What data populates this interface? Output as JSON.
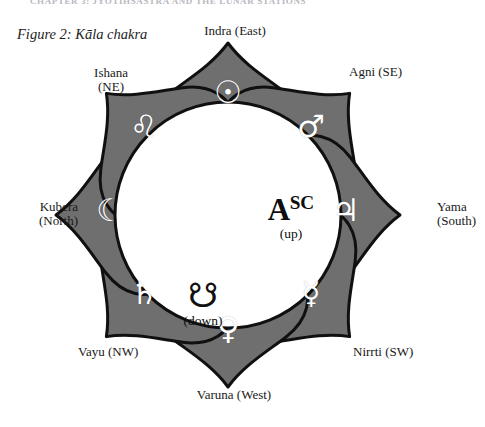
{
  "page": {
    "running_header": "CHAPTER 3: JYOTIHSASTRA AND THE LUNAR STATIONS",
    "figure_caption": "Figure 2: Kāla chakra",
    "background_color": "#ffffff",
    "petal_fill": "#6f6f6f",
    "petal_stroke": "#111111",
    "hub_fill": "#ffffff",
    "symbol_color": "#ffffff",
    "text_color": "#191919"
  },
  "diagram": {
    "name": "kala-chakra",
    "hub": {
      "ascendant": {
        "letter": "A",
        "superscript": "SC",
        "note": "(up)"
      },
      "descendant_node": {
        "glyph": "☋",
        "glyph_name": "descending-lunar-node-ketu",
        "note": "(down)"
      }
    },
    "petals": [
      {
        "id": "east",
        "direction_label": "Indra (East)",
        "deity": "Indra",
        "direction": "East",
        "glyph": "☉",
        "glyph_name": "sun-symbol",
        "planet": "Sun",
        "angle_deg": -90
      },
      {
        "id": "se",
        "direction_label": "Agni (SE)",
        "deity": "Agni",
        "direction": "SE",
        "glyph": "♂",
        "glyph_name": "mars-symbol",
        "planet": "Mars",
        "angle_deg": -45
      },
      {
        "id": "south",
        "direction_label": "Yama\n(South)",
        "direction_label_line1": "Yama",
        "direction_label_line2": "(South)",
        "deity": "Yama",
        "direction": "South",
        "glyph": "♃",
        "glyph_name": "jupiter-symbol",
        "planet": "Jupiter",
        "angle_deg": 0
      },
      {
        "id": "sw",
        "direction_label": "Nirrti (SW)",
        "deity": "Nirrti",
        "direction": "SW",
        "glyph": "☿",
        "glyph_name": "mercury-symbol",
        "planet": "Mercury",
        "angle_deg": 45
      },
      {
        "id": "west",
        "direction_label": "Varuna (West)",
        "deity": "Varuna",
        "direction": "West",
        "glyph": "♀",
        "glyph_name": "venus-symbol",
        "planet": "Venus",
        "angle_deg": 90
      },
      {
        "id": "nw",
        "direction_label": "Vayu (NW)",
        "deity": "Vayu",
        "direction": "NW",
        "glyph": "♄",
        "glyph_name": "saturn-symbol",
        "planet": "Saturn",
        "angle_deg": 135
      },
      {
        "id": "north",
        "direction_label": "Kubera\n(North)",
        "direction_label_line1": "Kubera",
        "direction_label_line2": "(North)",
        "deity": "Kubera",
        "direction": "North",
        "glyph": "☾",
        "glyph_name": "moon-symbol",
        "planet": "Moon",
        "angle_deg": 180
      },
      {
        "id": "ne",
        "direction_label": "Ishana\n(NE)",
        "direction_label_line1": "Ishana",
        "direction_label_line2": "(NE)",
        "deity": "Ishana",
        "direction": "NE",
        "glyph": "♌",
        "glyph_name": "leo-symbol",
        "planet": "Leo",
        "angle_deg": -135
      }
    ]
  }
}
